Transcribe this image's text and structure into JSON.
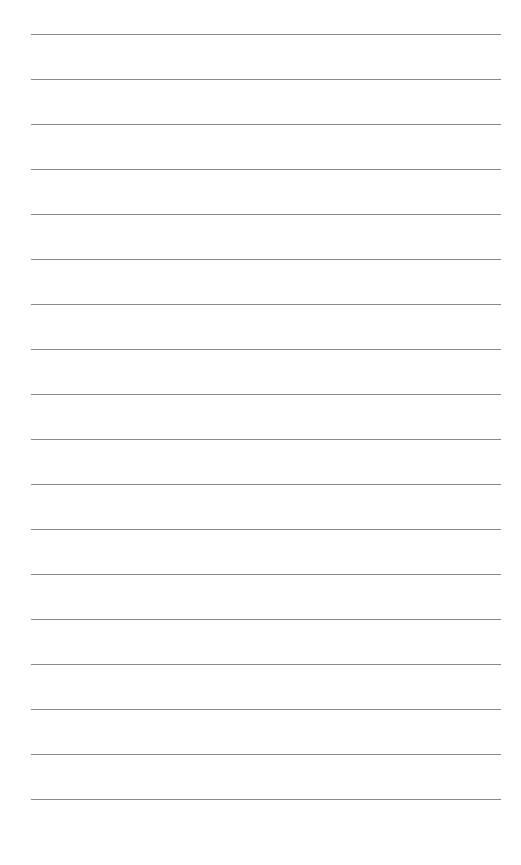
{
  "page": {
    "type": "lined-paper",
    "background": "#ffffff",
    "line_color": "#8a8a8a",
    "line_count": 18,
    "first_line_y": 34,
    "line_spacing": 45,
    "line_left": 31,
    "line_right": 501
  }
}
